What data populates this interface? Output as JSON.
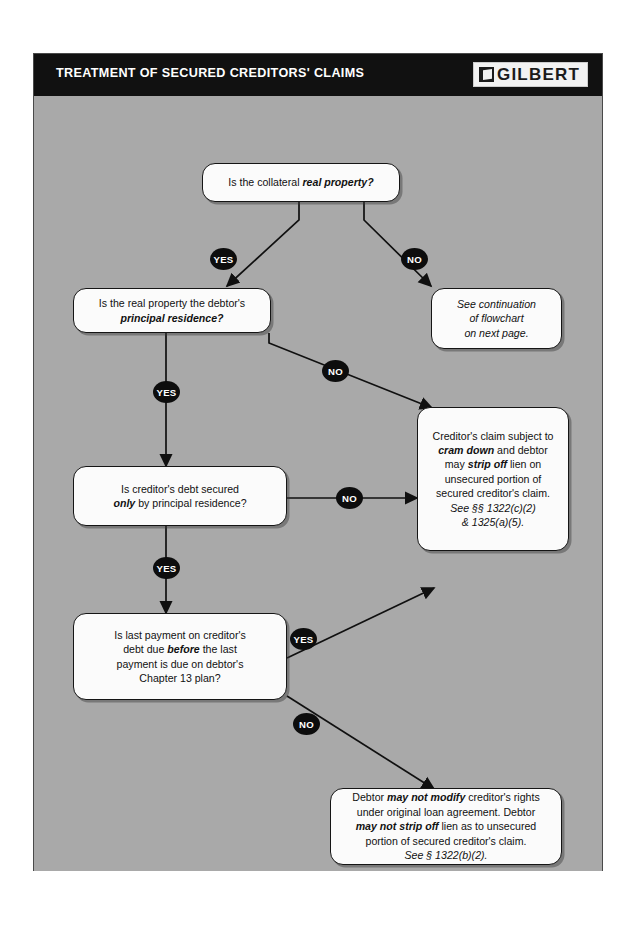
{
  "header": {
    "title": "TREATMENT OF SECURED CREDITORS' CLAIMS",
    "logo_text": "GILBERT",
    "logo_icon": "book-icon",
    "bar_color": "#111111",
    "title_color": "#ffffff"
  },
  "canvas": {
    "background_color": "#a9a9a9",
    "node_fill": "#fbfbfb",
    "node_border": "#151515",
    "badge_color": "#0d0d0d"
  },
  "labels": {
    "yes": "YES",
    "no": "NO"
  },
  "nodes": {
    "collateral": {
      "id": "is-collateral-real-property",
      "text_plain": "Is the collateral real property?",
      "lead": "Is the collateral ",
      "emph": "real property?"
    },
    "principal_residence": {
      "id": "is-real-property-principal-residence",
      "text_plain": "Is the real property the debtor's principal residence?",
      "line1": "Is the real property the debtor's",
      "emph": "principal residence?"
    },
    "continuation": {
      "id": "see-continuation-of-flowchart",
      "text_plain": "See continuation of flowchart on next page.",
      "line1": "See continuation",
      "line2": "of flowchart",
      "line3": "on next page."
    },
    "debt_secured_only": {
      "id": "is-debt-secured-only-by-principal-residence",
      "text_plain": "Is creditor's debt secured only by principal residence?",
      "line1": "Is creditor's debt secured",
      "emph": "only",
      "line2_rest": " by principal residence?"
    },
    "cram_down": {
      "id": "cram-down-and-strip-off-outcome",
      "text_plain": "Creditor's claim subject to cram down and debtor may strip off lien on unsecured portion of secured creditor's claim. See §§ 1322(c)(2) & 1325(a)(5).",
      "line1": "Creditor's claim subject to",
      "emph1": "cram down",
      "line2_rest": " and debtor",
      "line3_lead": "may ",
      "emph2": "strip off",
      "line3_rest": " lien on",
      "line4": "unsecured portion of",
      "line5": "secured creditor's claim.",
      "cite1": "See §§ 1322(c)(2)",
      "cite2": "& 1325(a)(5)."
    },
    "last_payment": {
      "id": "is-last-payment-due-before-plan-last-payment",
      "text_plain": "Is last payment on creditor's debt due before the last payment is due on debtor's Chapter 13 plan?",
      "line1": "Is last payment on creditor's",
      "line2_lead": "debt due ",
      "emph": "before",
      "line2_rest": " the last",
      "line3": "payment is due on debtor's",
      "line4": "Chapter 13 plan?"
    },
    "no_modify": {
      "id": "may-not-modify-outcome",
      "text_plain": "Debtor may not modify creditor's rights under original loan agreement. Debtor may not strip off lien as to unsecured portion of secured creditor's claim. See § 1322(b)(2).",
      "line1_lead": "Debtor ",
      "emph1": "may not modify",
      "line1_rest": " creditor's rights",
      "line2": "under original loan agreement.  Debtor",
      "emph2": "may not strip off",
      "line3_rest": " lien as to unsecured",
      "line4": "portion  of secured creditor's claim.",
      "cite": "See § 1322(b)(2)."
    }
  },
  "edges": [
    {
      "from": "collateral",
      "to": "principal_residence",
      "label": "YES"
    },
    {
      "from": "collateral",
      "to": "continuation",
      "label": "NO"
    },
    {
      "from": "principal_residence",
      "to": "debt_secured_only",
      "label": "YES"
    },
    {
      "from": "principal_residence",
      "to": "cram_down",
      "label": "NO"
    },
    {
      "from": "debt_secured_only",
      "to": "cram_down",
      "label": "NO"
    },
    {
      "from": "debt_secured_only",
      "to": "last_payment",
      "label": "YES"
    },
    {
      "from": "last_payment",
      "to": "cram_down",
      "label": "YES"
    },
    {
      "from": "last_payment",
      "to": "no_modify",
      "label": "NO"
    }
  ]
}
